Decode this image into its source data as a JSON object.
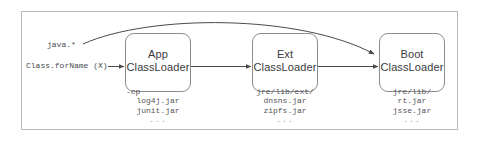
{
  "diagram": {
    "frame_color": "#b9b9bb",
    "box_border_color": "#8d8d90",
    "arrow_color": "#4a4a4e",
    "background": "#ffffff",
    "labels": {
      "package_filter": "java.*",
      "entry_call": "Class.forName (X)"
    },
    "nodes": [
      {
        "id": "app",
        "title_line1": "App",
        "title_line2": "ClassLoader",
        "path": "-cp",
        "entries": [
          "log4j.jar",
          "junit.jar"
        ],
        "ellipsis": "..."
      },
      {
        "id": "ext",
        "title_line1": "Ext",
        "title_line2": "ClassLoader",
        "path": "jre/lib/ext/",
        "entries": [
          "dnsns.jar",
          "zipfs.jar"
        ],
        "ellipsis": "..."
      },
      {
        "id": "boot",
        "title_line1": "Boot",
        "title_line2": "ClassLoader",
        "path": "jre/lib/",
        "entries": [
          "rt.jar",
          "jsse.jar"
        ],
        "ellipsis": "..."
      }
    ]
  }
}
